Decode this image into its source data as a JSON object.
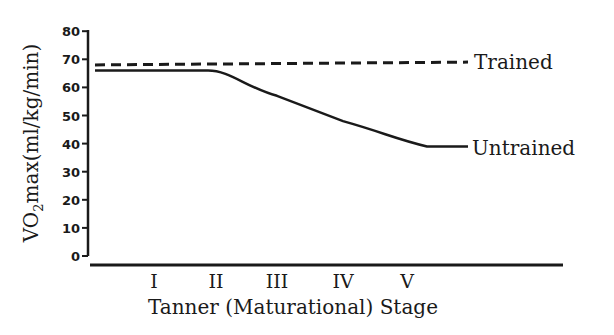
{
  "chart_data": {
    "type": "line",
    "title": "",
    "xlabel": "Tanner (Maturational) Stage",
    "ylabel": "VO2max(ml/kg/min)",
    "ylabel_parts": {
      "main": "VO",
      "sub": "2",
      "rest": "max(ml/kg/min)"
    },
    "ylim": [
      0,
      80
    ],
    "yticks": [
      "0",
      "10",
      "20",
      "30",
      "40",
      "50",
      "60",
      "70",
      "80"
    ],
    "categories": [
      "I",
      "II",
      "III",
      "IV",
      "V"
    ],
    "grid": false,
    "legend_position": "inline-right",
    "series": [
      {
        "name": "Trained",
        "style": "dashed",
        "values": [
          68,
          68,
          68.5,
          69,
          69
        ],
        "start_value": 68,
        "end_value": 69
      },
      {
        "name": "Untrained",
        "style": "solid",
        "values": [
          66,
          66,
          57,
          48,
          41
        ],
        "start_value": 66,
        "end_value": 39
      }
    ]
  },
  "colors": {
    "ink": "#1a1a1a",
    "background": "#ffffff"
  }
}
